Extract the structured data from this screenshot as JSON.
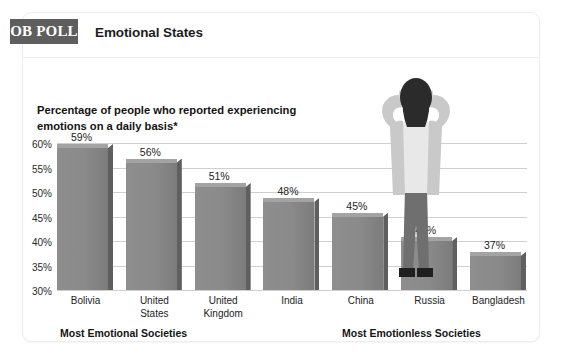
{
  "brand": {
    "badge": "OB POLL"
  },
  "header": {
    "title": "Emotional States"
  },
  "subtitle": "Percentage of people who reported experiencing emotions on a daily basis*",
  "annotations": {
    "left_group": "Most Emotional Societies",
    "right_group": "Most Emotionless Societies"
  },
  "colors": {
    "badge_background": "#5e5e5e",
    "bar_front": "#8a8a8a",
    "bar_top": "#a3a3a3",
    "bar_side": "#5f5f5f",
    "gridline": "#cfcfcf",
    "card_background": "#ffffff",
    "text": "#1d1d1d"
  },
  "illustration": {
    "name": "frustrated-person-hands-on-head",
    "hair_color": "#2b2b2b",
    "cardigan_color": "#c9c9c9",
    "shirt_color": "#e8e8e8",
    "skin_color": "#d8d4cf",
    "pants_color": "#6f6f6f",
    "shoe_color": "#1f1f1f"
  },
  "chart_data": {
    "type": "bar",
    "title": "Emotional States",
    "subtitle": "Percentage of people who reported experiencing emotions on a daily basis*",
    "categories": [
      "Bolivia",
      "United States",
      "United Kingdom",
      "India",
      "China",
      "Russia",
      "Bangladesh"
    ],
    "values": [
      59,
      56,
      51,
      48,
      45,
      40,
      37
    ],
    "value_labels": [
      "59%",
      "56%",
      "51%",
      "48%",
      "45%",
      "40%",
      "37%"
    ],
    "xlabel": "",
    "ylabel": "",
    "ylim": [
      30,
      60
    ],
    "yticks": [
      60,
      55,
      50,
      45,
      40,
      35,
      30
    ],
    "ytick_labels": [
      "60%",
      "55%",
      "50%",
      "45%",
      "40%",
      "35%",
      "30%"
    ],
    "grid": true,
    "legend": false,
    "groups": [
      {
        "label": "Most Emotional Societies",
        "categories": [
          "Bolivia",
          "United States",
          "United Kingdom"
        ]
      },
      {
        "label": "Most Emotionless Societies",
        "categories": [
          "China",
          "Russia",
          "Bangladesh"
        ]
      }
    ]
  }
}
